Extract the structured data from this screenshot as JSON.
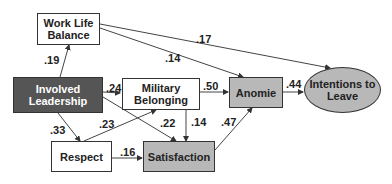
{
  "nodes": {
    "work_life_balance": {
      "label": "Work Life Balance"
    },
    "involved_leadership": {
      "label": "Involved Leadership"
    },
    "military_belonging": {
      "label": "Military Belonging"
    },
    "respect": {
      "label": "Respect"
    },
    "satisfaction": {
      "label": "Satisfaction"
    },
    "anomie": {
      "label": "Anomie"
    },
    "intentions_to_leave": {
      "label": "Intentions to Leave"
    }
  },
  "edges": [
    {
      "from": "Involved Leadership",
      "to": "Work Life Balance",
      "coef": ".19"
    },
    {
      "from": "Work Life Balance",
      "to": "Anomie",
      "coef": ".14"
    },
    {
      "from": "Work Life Balance",
      "to": "Intentions to Leave",
      "coef": ".17"
    },
    {
      "from": "Involved Leadership",
      "to": "Military Belonging",
      "coef": ".24"
    },
    {
      "from": "Involved Leadership",
      "to": "Respect",
      "coef": ".33"
    },
    {
      "from": "Involved Leadership",
      "to": "Satisfaction",
      "coef": ".22"
    },
    {
      "from": "Respect",
      "to": "Military Belonging",
      "coef": ".23"
    },
    {
      "from": "Respect",
      "to": "Satisfaction",
      "coef": ".16"
    },
    {
      "from": "Military Belonging",
      "to": "Anomie",
      "coef": ".50"
    },
    {
      "from": "Military Belonging",
      "to": "Satisfaction",
      "coef": ".14"
    },
    {
      "from": "Satisfaction",
      "to": "Anomie",
      "coef": ".47"
    },
    {
      "from": "Anomie",
      "to": "Intentions to Leave",
      "coef": ".44"
    }
  ]
}
